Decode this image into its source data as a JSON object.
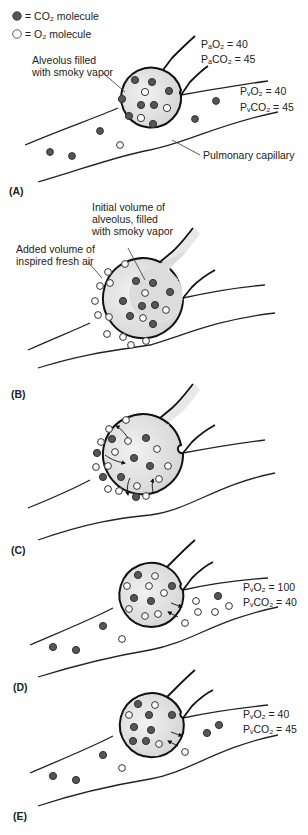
{
  "legend": {
    "co2": {
      "label": "= CO₂ molecule",
      "color": "#555555"
    },
    "o2": {
      "label": "= O₂ molecule",
      "color": "#ffffff"
    }
  },
  "colors": {
    "co2_fill": "#555555",
    "o2_fill": "#ffffff",
    "outline": "#111111",
    "alveolus_fill": "#e4e4e4"
  },
  "panels": [
    {
      "id": "A",
      "label": "(A)",
      "annotations": {
        "alveolus": "Alveolus filled",
        "alveolus2": "with smoky vapor",
        "pa_o2": "PₐO₂ = 40",
        "pa_co2": "PₐCO₂ = 45",
        "pv_o2": "PᵥO₂ = 40",
        "pv_co2": "PᵥCO₂ = 45",
        "capillary": "Pulmonary capillary"
      },
      "values": {
        "PAO2": 40,
        "PACO2": 45,
        "PVO2": 40,
        "PVCO2": 45
      }
    },
    {
      "id": "B",
      "label": "(B)",
      "annotations": {
        "initial1": "Initial volume of",
        "initial2": "alveolus, filled",
        "initial3": "with smoky vapor",
        "added1": "Added volume of",
        "added2": "inspired fresh air"
      }
    },
    {
      "id": "C",
      "label": "(C)"
    },
    {
      "id": "D",
      "label": "(D)",
      "annotations": {
        "pv_o2": "PᵥO₂ = 100",
        "pv_co2": "PᵥCO₂ = 40"
      },
      "values": {
        "PVO2": 100,
        "PVCO2": 40
      }
    },
    {
      "id": "E",
      "label": "(E)",
      "annotations": {
        "pv_o2": "PᵥO₂ = 40",
        "pv_co2": "PᵥCO₂ = 45"
      },
      "values": {
        "PVO2": 40,
        "PVCO2": 45
      }
    }
  ]
}
